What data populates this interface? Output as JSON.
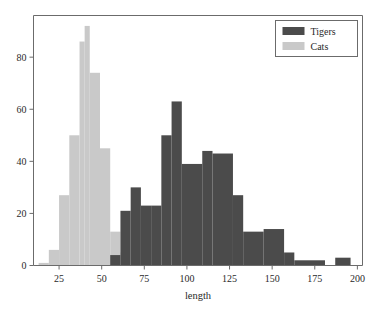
{
  "chart_data": {
    "type": "bar",
    "subtype": "histogram-overlay",
    "title": "",
    "xlabel": "length",
    "ylabel": "",
    "xlim": [
      10,
      203
    ],
    "ylim": [
      0,
      96
    ],
    "xticks": [
      25,
      50,
      75,
      100,
      125,
      150,
      175,
      200
    ],
    "yticks": [
      0,
      20,
      40,
      60,
      80
    ],
    "xtick_labels": [
      "25",
      "50",
      "75",
      "100",
      "125",
      "150",
      "175",
      "200"
    ],
    "ytick_labels": [
      "0",
      "20",
      "40",
      "60",
      "80"
    ],
    "grid": false,
    "legend_position": "top-right",
    "bin_width": 6,
    "series": [
      {
        "name": "Cats",
        "color": "#c9c9c9",
        "bins": [
          {
            "x0": 13,
            "x1": 19,
            "value": 1
          },
          {
            "x0": 19,
            "x1": 25,
            "value": 6
          },
          {
            "x0": 25,
            "x1": 31,
            "value": 27
          },
          {
            "x0": 31,
            "x1": 37,
            "value": 50
          },
          {
            "x0": 37,
            "x1": 40,
            "value": 86
          },
          {
            "x0": 40,
            "x1": 43,
            "value": 92
          },
          {
            "x0": 43,
            "x1": 49,
            "value": 74
          },
          {
            "x0": 49,
            "x1": 55,
            "value": 45
          },
          {
            "x0": 55,
            "x1": 61,
            "value": 13
          },
          {
            "x0": 61,
            "x1": 64,
            "value": 5
          }
        ]
      },
      {
        "name": "Tigers",
        "color": "#4b4b4b",
        "bins": [
          {
            "x0": 55,
            "x1": 61,
            "value": 4
          },
          {
            "x0": 61,
            "x1": 67,
            "value": 21
          },
          {
            "x0": 67,
            "x1": 73,
            "value": 30
          },
          {
            "x0": 73,
            "x1": 79,
            "value": 23
          },
          {
            "x0": 79,
            "x1": 85,
            "value": 23
          },
          {
            "x0": 85,
            "x1": 91,
            "value": 50
          },
          {
            "x0": 91,
            "x1": 97,
            "value": 63
          },
          {
            "x0": 97,
            "x1": 109,
            "value": 39
          },
          {
            "x0": 109,
            "x1": 115,
            "value": 44
          },
          {
            "x0": 115,
            "x1": 127,
            "value": 43
          },
          {
            "x0": 127,
            "x1": 133,
            "value": 27
          },
          {
            "x0": 133,
            "x1": 145,
            "value": 13
          },
          {
            "x0": 145,
            "x1": 157,
            "value": 14
          },
          {
            "x0": 157,
            "x1": 163,
            "value": 5
          },
          {
            "x0": 163,
            "x1": 181,
            "value": 2
          },
          {
            "x0": 187,
            "x1": 196,
            "value": 3
          }
        ]
      }
    ],
    "legend": [
      {
        "label": "Tigers",
        "color": "#4b4b4b"
      },
      {
        "label": "Cats",
        "color": "#c9c9c9"
      }
    ]
  }
}
